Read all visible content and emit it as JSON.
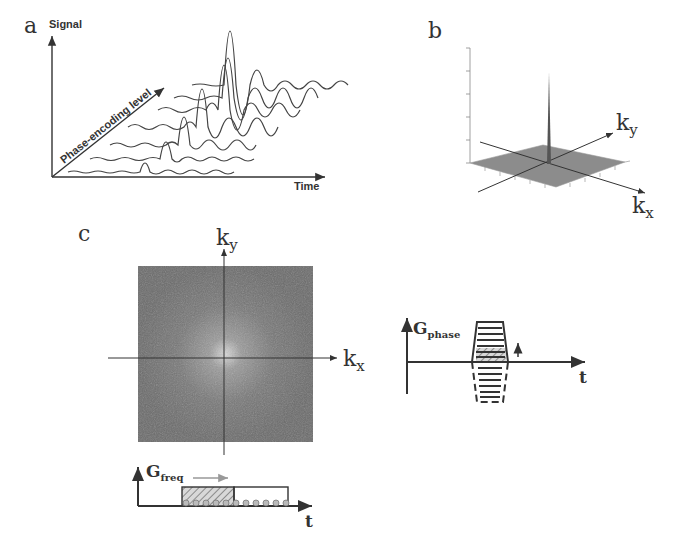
{
  "panel_a": {
    "label": "a",
    "y_axis_label": "Signal",
    "x_axis_label": "Time",
    "diagonal_label": "Phase-encoding level",
    "num_echoes": 7
  },
  "panel_b": {
    "label": "b",
    "axis_x": "k",
    "axis_x_sub": "x",
    "axis_y": "k",
    "axis_y_sub": "y"
  },
  "panel_c": {
    "label": "c",
    "axis_x": "k",
    "axis_x_sub": "x",
    "axis_y": "k",
    "axis_y_sub": "y",
    "gfreq_label": "G",
    "gfreq_sub": "freq",
    "gfreq_t": "t",
    "gphase_label": "G",
    "gphase_sub": "phase",
    "gphase_t": "t"
  },
  "colors": {
    "line": "#333333",
    "kspace_bg": "#6e6e6e",
    "plane": "#8a8a8a",
    "arrow_gray": "#9a9a9a"
  }
}
